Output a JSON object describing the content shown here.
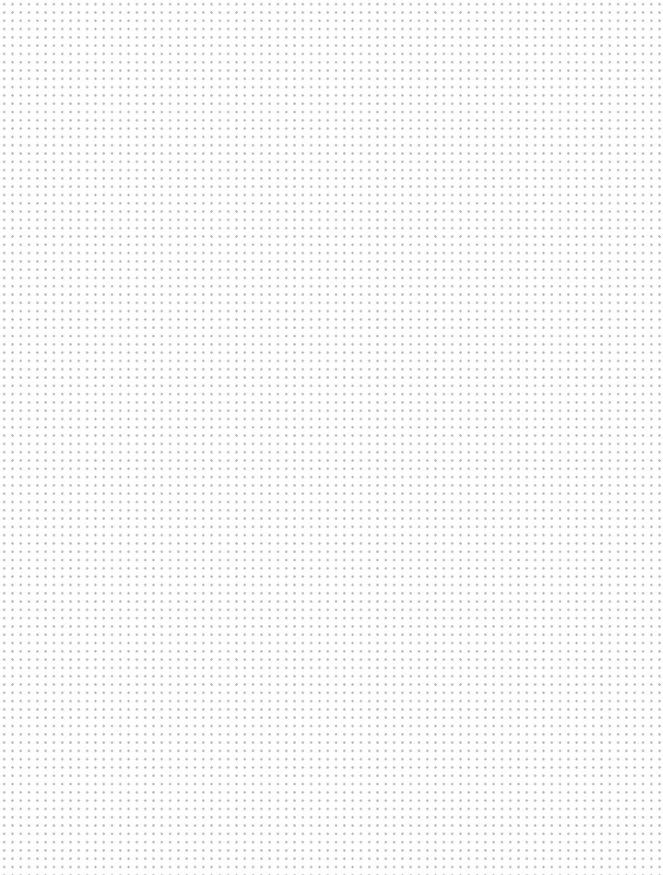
{
  "canvas": {
    "width": 663,
    "height": 875,
    "background_color": "#ffffff",
    "surface_label": "",
    "content_text": ""
  },
  "grid": {
    "pattern": "dot-grid",
    "dot_color": "#bcbcbc",
    "dot_diameter_px": 2,
    "spacing_px": 8.3,
    "origin_offset_px": 0,
    "label": ""
  },
  "content": {
    "items": [],
    "empty_state_text": ""
  }
}
